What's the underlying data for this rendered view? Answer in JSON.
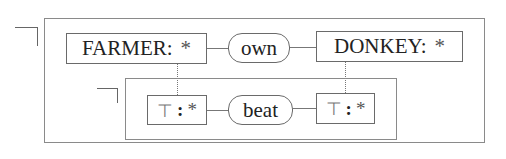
{
  "diagram": {
    "type": "conceptual-graph",
    "outer_context": {
      "negated": true,
      "concepts": [
        {
          "type": "FARMER",
          "referent": "*"
        },
        {
          "type": "DONKEY",
          "referent": "*"
        }
      ],
      "relations": [
        {
          "label": "own",
          "from": "FARMER",
          "to": "DONKEY"
        }
      ]
    },
    "inner_context": {
      "negated": true,
      "concepts": [
        {
          "type": "⊤",
          "referent": "*",
          "coreferent_with": "FARMER"
        },
        {
          "type": "⊤",
          "referent": "*",
          "coreferent_with": "DONKEY"
        }
      ],
      "relations": [
        {
          "label": "beat"
        }
      ]
    },
    "labels": {
      "farmer_type": "FARMER:",
      "farmer_ref": "*",
      "own": "own",
      "donkey_type": "DONKEY:",
      "donkey_ref": "*",
      "top1_type": "⊤",
      "top1_colon": ":",
      "top1_ref": "*",
      "beat": "beat",
      "top2_type": "⊤",
      "top2_colon": ":",
      "top2_ref": "*"
    }
  }
}
